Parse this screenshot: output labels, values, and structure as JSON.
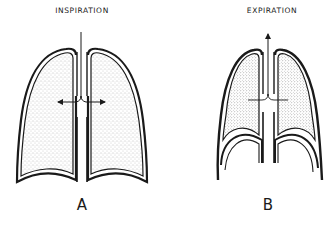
{
  "figure": {
    "panels": [
      {
        "id": "A",
        "title": "INSPIRATION",
        "letter": "A",
        "airflow": "inward (arrows pointing outward into lungs)"
      },
      {
        "id": "B",
        "title": "EXPIRATION",
        "letter": "B",
        "airflow": "outward (arrow pointing up through trachea)"
      }
    ],
    "colors": {
      "ink": "#1a1a1a",
      "stipple": "#8a8a8a",
      "background": "#ffffff"
    }
  }
}
